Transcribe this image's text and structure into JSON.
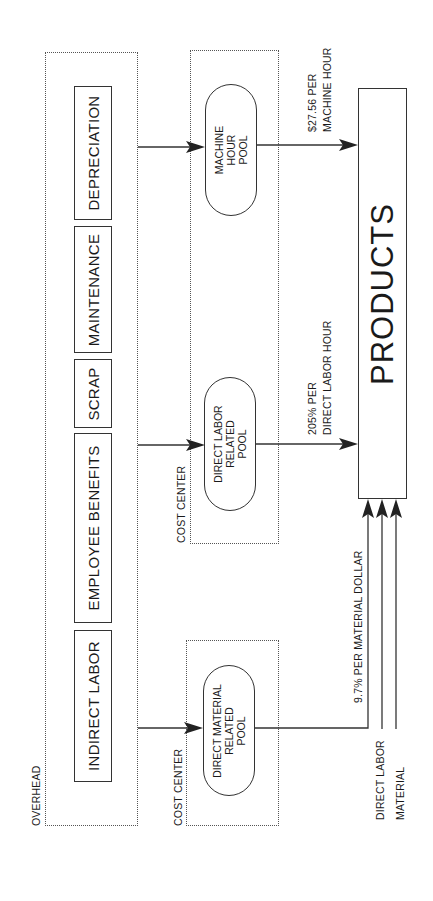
{
  "diagram": {
    "orientation": "rotated-90-ccw",
    "overhead": {
      "label": "OVERHEAD",
      "items": [
        {
          "id": "indirect-labor",
          "label": "INDIRECT LABOR"
        },
        {
          "id": "employee-benefits",
          "label": "EMPLOYEE BENEFITS"
        },
        {
          "id": "scrap",
          "label": "SCRAP"
        },
        {
          "id": "maintenance",
          "label": "MAINTENANCE"
        },
        {
          "id": "depreciation",
          "label": "DEPRECIATION"
        }
      ]
    },
    "cost_centers": [
      {
        "label": "COST CENTER",
        "pools": [
          {
            "id": "direct-material-pool",
            "lines": [
              "DIRECT MATERIAL",
              "RELATED",
              "POOL"
            ]
          }
        ]
      },
      {
        "label": "COST CENTER",
        "pools": [
          {
            "id": "direct-labor-pool",
            "lines": [
              "DIRECT LABOR",
              "RELATED",
              "POOL"
            ]
          },
          {
            "id": "machine-hour-pool",
            "lines": [
              "MACHINE",
              "HOUR",
              "POOL"
            ]
          }
        ]
      }
    ],
    "rates": {
      "material": "9.7% PER MATERIAL DOLLAR",
      "labor_line1": "205% PER",
      "labor_line2": "DIRECT LABOR HOUR",
      "machine_line1": "$27.56 PER",
      "machine_line2": "MACHINE HOUR"
    },
    "direct_inputs": {
      "direct_labor": "DIRECT LABOR",
      "material": "MATERIAL"
    },
    "products": {
      "label": "PRODUCTS"
    }
  }
}
